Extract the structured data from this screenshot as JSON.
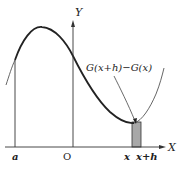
{
  "figure": {
    "type": "calculus-area-diagram"
  },
  "axes": {
    "x_label": "X",
    "y_label": "Y",
    "origin_label": "O"
  },
  "ticks": {
    "a_label": "a",
    "x_label": "x",
    "xh_label": "x+h"
  },
  "annotation": {
    "label": "G(x+h)−G(x)"
  },
  "colors": {
    "curve": "#222222",
    "curve_light": "#555555",
    "axis": "#333333",
    "strip_fill": "#a8a8a8",
    "strip_stroke": "#333333"
  }
}
